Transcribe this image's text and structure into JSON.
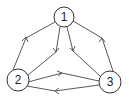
{
  "diagram": {
    "type": "directed-graph",
    "nodes": [
      {
        "id": "1",
        "label": "1",
        "x": 64,
        "y": 17,
        "r": 10
      },
      {
        "id": "2",
        "label": "2",
        "x": 18,
        "y": 80,
        "r": 11
      },
      {
        "id": "3",
        "label": "3",
        "x": 110,
        "y": 82,
        "r": 11
      }
    ],
    "edges": [
      {
        "from": "2",
        "to": "1",
        "label": ""
      },
      {
        "from": "1",
        "to": "2",
        "label": ""
      },
      {
        "from": "1",
        "to": "3",
        "label": ""
      },
      {
        "from": "3",
        "to": "1",
        "label": ""
      },
      {
        "from": "2",
        "to": "3",
        "label": ""
      },
      {
        "from": "3",
        "to": "2",
        "label": ""
      }
    ],
    "colors": {
      "stroke": "#444444",
      "background": "#ffffff"
    }
  }
}
